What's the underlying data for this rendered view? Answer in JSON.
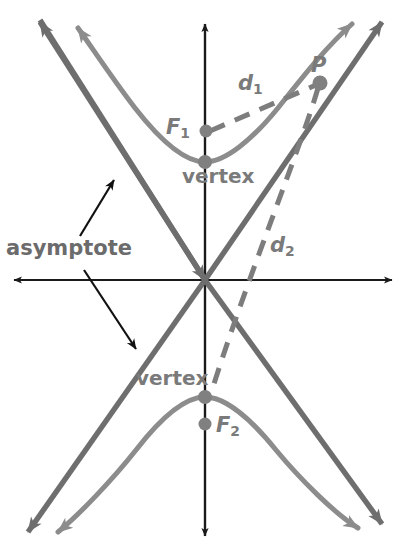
{
  "figure": {
    "colors": {
      "axis": "#1a1a1a",
      "hyperbola": "#8c8c8c",
      "asymptote": "#6e6e6e",
      "dashed": "#7d7d7d",
      "point": "#808080",
      "label": "#7a7a7a",
      "pointer": "#111111",
      "background": "#ffffff"
    },
    "labels": {
      "asymptote": "asymptote",
      "vertex_top": "vertex",
      "vertex_bottom": "vertex",
      "focus_1": "F",
      "focus_1_sub": "1",
      "focus_2": "F",
      "focus_2_sub": "2",
      "distance_1": "d",
      "distance_1_sub": "1",
      "distance_2": "d",
      "distance_2_sub": "2",
      "point_p": "P"
    },
    "geometry": {
      "origin": {
        "x": 205,
        "y": 280
      },
      "x_axis": {
        "from_x": 10,
        "to_x": 396,
        "y": 280
      },
      "y_axis": {
        "x": 205,
        "from_y": 20,
        "to_y": 540
      },
      "vertex_top": {
        "x": 205,
        "y": 162
      },
      "vertex_bottom": {
        "x": 205,
        "y": 397
      },
      "focus_1": {
        "x": 206,
        "y": 131
      },
      "focus_2": {
        "x": 205,
        "y": 424
      },
      "point_p": {
        "x": 320,
        "y": 83
      }
    }
  }
}
